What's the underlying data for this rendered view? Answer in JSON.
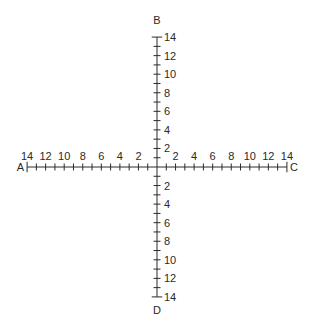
{
  "diagram": {
    "title": "",
    "axes": {
      "left_end_label": "A",
      "right_end_label": "C",
      "top_end_label": "B",
      "bottom_end_label": "D",
      "min": 0,
      "max": 14,
      "tick_step": 1,
      "label_step": 2
    },
    "labels": {
      "left": [
        "14",
        "12",
        "10",
        "8",
        "6",
        "4",
        "2"
      ],
      "right": [
        "2",
        "4",
        "6",
        "8",
        "10",
        "12",
        "14"
      ],
      "up": [
        "2",
        "4",
        "6",
        "8",
        "10",
        "12",
        "14"
      ],
      "down": [
        "2",
        "4",
        "6",
        "8",
        "10",
        "12",
        "14"
      ]
    },
    "colors": {
      "ink": "#2a2a2a",
      "background": "#ffffff"
    }
  }
}
